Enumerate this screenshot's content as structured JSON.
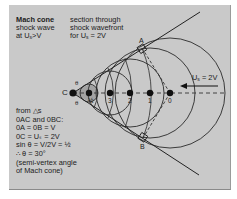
{
  "title": {
    "heading": "Mach cone",
    "line2": "shock wave",
    "line3_prefix": "at U",
    "line3_sub": "s",
    "line3_suffix": ">V"
  },
  "section": {
    "line1": "section through",
    "line2": "shock wavefront",
    "line3_prefix": "for U",
    "line3_sub": "s",
    "line3_suffix": " = 2V"
  },
  "velocity_label": {
    "prefix": "U",
    "sub": "s",
    "suffix": " = 2V"
  },
  "points": {
    "C": "C",
    "half": "½",
    "p3": "3",
    "p2": "2",
    "p1": "1",
    "p0": "0",
    "A": "A",
    "B": "B"
  },
  "angle_label": "θ",
  "derivation": [
    "from △s",
    "0AC and 0BC:",
    "0A = 0B = V",
    "0C = Uₛ = 2V",
    "sin θ = V/2V = ½",
    "∴ θ = 30°",
    "(semi-vertex angle",
    "of Mach cone)"
  ],
  "colors": {
    "panel": "#c9c9c9",
    "ink": "#1c1c1c",
    "cone_fill": "#9a9a9a"
  }
}
